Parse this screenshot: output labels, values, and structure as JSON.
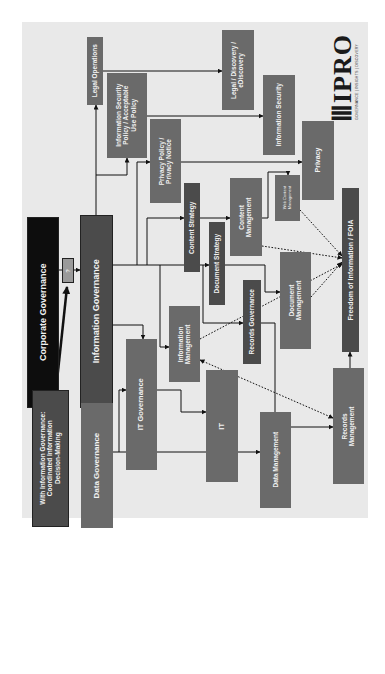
{
  "diagram": {
    "orientation": "rotated-90-ccw",
    "colors": {
      "background": "#ffffff",
      "panel": "#e9e9e9",
      "box_dark": "#4b4b4b",
      "box_black": "#0d0d0d",
      "box_grey": "#6a6a6a",
      "text": "#f2f2f2",
      "connector": "#111111"
    },
    "nodes": {
      "with_ig": "With Information Governance:\nCoordinated Information\nDecision-Making",
      "corporate_governance": "Corporate Governance",
      "question": "?",
      "information_governance": "Information Governance",
      "legal_operations": "Legal Operations",
      "infosec_policy": "Information Security\nPolicy / Acceptable\nUse Policy",
      "privacy_policy": "Privacy Policy /\nPrivacy Notice",
      "content_strategy": "Content Strategy",
      "document_strategy": "Document Strategy",
      "content_management": "Content\nManagement",
      "web_content_management": "Web Content\nManagement",
      "legal_discovery": "Legal / Discovery /\neDiscovery",
      "information_security": "Information Security",
      "privacy": "Privacy",
      "foia": "Freedom of Information / FOIA",
      "document_management": "Document\nManagement",
      "records_governance": "Records Governance",
      "information_management": "Information\nManagement",
      "it_governance": "IT Governance",
      "it": "IT",
      "data_management": "Data Management",
      "records_management": "Records\nManagement",
      "data_governance": "Data Governance"
    },
    "edges": [
      {
        "from": "with_ig",
        "to": "question",
        "style": "thick"
      },
      {
        "from": "corporate_governance",
        "to": "information_governance",
        "via": "question"
      },
      {
        "from": "information_governance",
        "to": "legal_operations"
      },
      {
        "from": "information_governance",
        "to": "infosec_policy"
      },
      {
        "from": "information_governance",
        "to": "privacy_policy"
      },
      {
        "from": "information_governance",
        "to": "content_strategy"
      },
      {
        "from": "information_governance",
        "to": "document_strategy"
      },
      {
        "from": "information_governance",
        "to": "records_governance"
      },
      {
        "from": "information_governance",
        "to": "information_management"
      },
      {
        "from": "information_governance",
        "to": "it_governance"
      },
      {
        "from": "information_governance",
        "to": "data_governance"
      },
      {
        "from": "legal_operations",
        "to": "legal_discovery"
      },
      {
        "from": "infosec_policy",
        "to": "information_security"
      },
      {
        "from": "privacy_policy",
        "to": "privacy"
      },
      {
        "from": "content_strategy",
        "to": "content_management"
      },
      {
        "from": "content_management",
        "to": "web_content_management"
      },
      {
        "from": "document_strategy",
        "to": "document_management"
      },
      {
        "from": "records_governance",
        "to": "records_management"
      },
      {
        "from": "it_governance",
        "to": "it"
      },
      {
        "from": "data_governance",
        "to": "data_management"
      },
      {
        "from": "data_governance",
        "to": "it_governance"
      },
      {
        "from": "records_management",
        "to": "foia"
      },
      {
        "from": "content_management",
        "to": "foia",
        "style": "dotted"
      },
      {
        "from": "web_content_management",
        "to": "foia",
        "style": "dotted"
      },
      {
        "from": "document_management",
        "to": "foia",
        "style": "dotted"
      },
      {
        "from": "information_management",
        "to": "foia",
        "style": "dotted"
      },
      {
        "from": "information_management",
        "to": "records_management",
        "style": "dotted-bidirectional"
      }
    ]
  },
  "logo": {
    "mark": "IIIPRO",
    "name": "IPRO",
    "tagline": "GOVERNANCE | INSIGHTS | DISCOVERY"
  }
}
